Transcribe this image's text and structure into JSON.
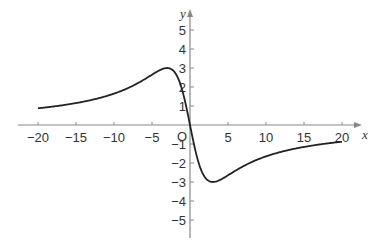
{
  "chart_data": {
    "type": "line",
    "title": "",
    "xlabel": "x",
    "ylabel": "y",
    "origin_label": "O",
    "xlim": [
      -20,
      20
    ],
    "ylim": [
      -5,
      5
    ],
    "x_ticks": [
      -20,
      -15,
      -10,
      -5,
      5,
      10,
      15,
      20
    ],
    "x_tick_labels": [
      "−20",
      "−15",
      "−10",
      "−5",
      "5",
      "10",
      "15",
      "20"
    ],
    "y_ticks": [
      -5,
      -4,
      -3,
      -2,
      -1,
      1,
      2,
      3,
      4,
      5
    ],
    "y_tick_labels": [
      "−5",
      "−4",
      "−3",
      "−2",
      "−1",
      "1",
      "2",
      "3",
      "4",
      "5"
    ],
    "grid": false,
    "legend": null,
    "series": [
      {
        "name": "y = -18x/(x^2+9)",
        "x": [
          -20,
          -15,
          -10,
          -7,
          -5,
          -4,
          -3,
          -2,
          -1,
          0,
          1,
          2,
          3,
          4,
          5,
          7,
          10,
          15,
          20
        ],
        "y": [
          0.88,
          1.15,
          1.65,
          2.17,
          2.65,
          2.88,
          3.0,
          2.77,
          1.8,
          0,
          -1.8,
          -2.77,
          -3.0,
          -2.88,
          -2.65,
          -2.17,
          -1.65,
          -1.15,
          -0.88
        ]
      }
    ],
    "annotations": {
      "maximum": {
        "x": -3,
        "y": 3
      },
      "minimum": {
        "x": 3,
        "y": -3
      }
    }
  },
  "colors": {
    "axis": "#888888",
    "curve": "#222222",
    "text": "#333333"
  }
}
